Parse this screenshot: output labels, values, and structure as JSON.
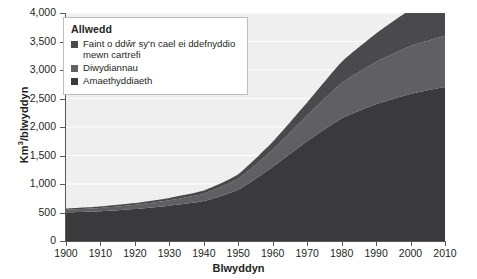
{
  "chart_data": {
    "type": "area",
    "stacked": true,
    "title": "",
    "xlabel": "Blwyddyn",
    "ylabel": "Km3/blwyddyn",
    "ylabel_display": "Km³/blwyddyn",
    "x": [
      1900,
      1910,
      1920,
      1930,
      1940,
      1950,
      1960,
      1970,
      1980,
      1990,
      2000,
      2010
    ],
    "categories": [
      "1900",
      "1910",
      "1920",
      "1930",
      "1940",
      "1950",
      "1960",
      "1970",
      "1980",
      "1990",
      "2000",
      "2010"
    ],
    "xlim": [
      1900,
      2010
    ],
    "ylim": [
      0,
      4000
    ],
    "ytick_values": [
      0,
      500,
      1000,
      1500,
      2000,
      2500,
      3000,
      3500,
      4000
    ],
    "ytick_labels": [
      "0",
      "500",
      "1,000",
      "1,500",
      "2,000",
      "2,500",
      "3,000",
      "3,500",
      "4,000"
    ],
    "xtick_labels": [
      "1900",
      "1910",
      "1920",
      "1930",
      "1940",
      "1950",
      "1960",
      "1970",
      "1980",
      "1990",
      "2000",
      "2010"
    ],
    "grid": true,
    "grid_color": "#ffffff",
    "plot_background": "#efefef",
    "legend_position": "top-left",
    "series": [
      {
        "name": "Amaethyddiaeth",
        "color": "#3a3a3c",
        "values": [
          500,
          520,
          560,
          620,
          700,
          900,
          1300,
          1750,
          2150,
          2400,
          2580,
          2700
        ]
      },
      {
        "name": "Diwydiannau",
        "color": "#606063",
        "values": [
          50,
          60,
          75,
          95,
          130,
          190,
          300,
          450,
          620,
          740,
          840,
          900
        ]
      },
      {
        "name": "Faint o ddŵr sy'n cael ei ddefnyddio mewn cartrefi",
        "color": "#4a4a4d",
        "values": [
          20,
          25,
          30,
          40,
          55,
          80,
          140,
          230,
          370,
          500,
          640,
          750
        ]
      }
    ],
    "totals": [
      570,
      605,
      665,
      755,
      885,
      1170,
      1740,
      2430,
      3140,
      3640,
      4060,
      4350
    ]
  },
  "legend": {
    "title": "Allwedd",
    "items": [
      {
        "label": "Faint o ddŵr sy'n cael ei ddefnyddio mewn cartrefi",
        "color": "#4a4a4d"
      },
      {
        "label": "Diwydiannau",
        "color": "#606063"
      },
      {
        "label": "Amaethyddiaeth",
        "color": "#3a3a3c"
      }
    ]
  },
  "axes": {
    "y_title_main": "Km",
    "y_title_sup": "3",
    "y_title_rest": "/blwyddyn",
    "x_title": "Blwyddyn"
  }
}
